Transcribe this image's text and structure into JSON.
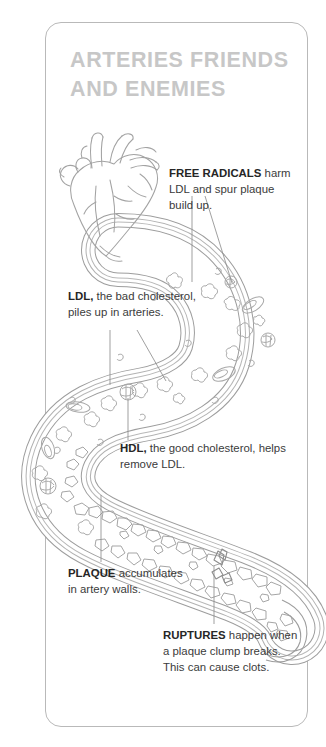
{
  "document": {
    "title": "Arteries Friends and Enemies",
    "heading": "ARTERIES FRIENDS AND ENEMIES"
  },
  "colors": {
    "title": "#c7c7c7",
    "body_text": "#3b3b3b",
    "term_text": "#262626",
    "card_border": "#b9b9b9",
    "artery_line": "#9a9a9a",
    "artery_line_light": "#b5b5b5",
    "particle_line": "#a8a8a8",
    "leader_line": "#8f8f8f",
    "background": "#ffffff"
  },
  "callouts": [
    {
      "id": "free-radicals",
      "term": "FREE RADICALS",
      "term_style": "caps-bold",
      "body": "harm LDL and spur plaque build up.",
      "full_text": "FREE RADICALS harm LDL and spur plaque build up."
    },
    {
      "id": "ldl",
      "term": "LDL,",
      "term_style": "bold",
      "body": "the bad cholesterol, piles up in arteries.",
      "full_text": "LDL, the bad cholesterol, piles up in arteries."
    },
    {
      "id": "hdl",
      "term": "HDL,",
      "term_style": "bold",
      "body": "the good cholesterol, helps remove LDL.",
      "full_text": "HDL, the good cholesterol, helps remove LDL."
    },
    {
      "id": "plaque",
      "term": "PLAQUE",
      "term_style": "caps-bold",
      "body": "accumulates in artery walls.",
      "full_text": "PLAQUE accumulates in artery walls."
    },
    {
      "id": "ruptures",
      "term": "RUPTURES",
      "term_style": "caps-bold",
      "body": "happen when a plaque clump breaks. This can cause clots.",
      "full_text": "RUPTURES happen when a plaque clump breaks. This can cause clots."
    }
  ],
  "illustration": {
    "heart_label": "anatomical-heart",
    "artery_label": "cross-section-artery",
    "particles_label": "cholesterol-particles",
    "plaque_label": "plaque-deposits",
    "rupture_label": "plaque-rupture"
  }
}
